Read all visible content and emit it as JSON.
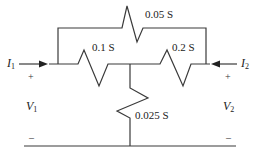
{
  "diagram": {
    "type": "two-port resistive network (conductances)",
    "components": {
      "top_resistor": {
        "label": "0.05 S"
      },
      "left_series_resistor": {
        "label": "0.1 S"
      },
      "right_series_resistor": {
        "label": "0.2 S"
      },
      "shunt_resistor": {
        "label": "0.025 S"
      }
    },
    "port1": {
      "current": {
        "symbol": "I",
        "subscript": "1",
        "direction": "into network (right)"
      },
      "voltage": {
        "symbol": "V",
        "subscript": "1"
      },
      "plus": "+",
      "minus": "–"
    },
    "port2": {
      "current": {
        "symbol": "I",
        "subscript": "2",
        "direction": "into network (left)"
      },
      "voltage": {
        "symbol": "V",
        "subscript": "2"
      },
      "plus": "+",
      "minus": "–"
    },
    "colors": {
      "line": "#3a3a3a",
      "text": "#222222",
      "background": "#ffffff"
    }
  }
}
